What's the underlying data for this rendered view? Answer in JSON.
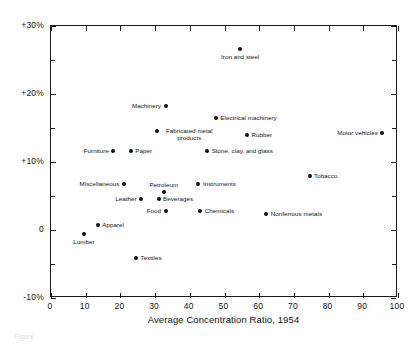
{
  "figure": {
    "top_clipped_note": "",
    "caption_clipped": "Figure"
  },
  "chart_data": {
    "type": "scatter",
    "title": "",
    "xlabel": "Average Concentration Ratio, 1954",
    "ylabel": "",
    "xlim": [
      0,
      100
    ],
    "ylim": [
      -10,
      30
    ],
    "xticks": [
      0,
      10,
      20,
      30,
      40,
      50,
      60,
      70,
      80,
      90,
      100
    ],
    "xtick_labels": [
      "0",
      "10",
      "20",
      "30",
      "40",
      "50",
      "60",
      "70",
      "80",
      "90",
      "100"
    ],
    "yticks": [
      -10,
      0,
      10,
      20,
      30
    ],
    "ytick_labels": [
      "-10%",
      "0",
      "+10%",
      "+20%",
      "+30%"
    ],
    "y_minor_ticks": [
      -5,
      5,
      15,
      25
    ],
    "x_minor_ticks": [
      5,
      15,
      25,
      35,
      45,
      55,
      65,
      75,
      85,
      95
    ],
    "grid": false,
    "legend": null,
    "marker_color": "#111111",
    "axis_color": "#1a1a1a",
    "points": [
      {
        "label": "Iron and steel",
        "x": 54.5,
        "y": 26.6,
        "label_pos": "below"
      },
      {
        "label": "Machinery",
        "x": 33.0,
        "y": 18.3,
        "label_pos": "left"
      },
      {
        "label": "Electrical machinery",
        "x": 47.5,
        "y": 16.5,
        "label_pos": "right"
      },
      {
        "label": "Motor vehicles",
        "x": 95.5,
        "y": 14.3,
        "label_pos": "left"
      },
      {
        "label": "Fabricated metal products",
        "x": 30.5,
        "y": 14.6,
        "label_pos": "multiline-right"
      },
      {
        "label": "Rubber",
        "x": 56.5,
        "y": 13.9,
        "label_pos": "right"
      },
      {
        "label": "Furniture",
        "x": 18.0,
        "y": 11.6,
        "label_pos": "left"
      },
      {
        "label": "Paper",
        "x": 23.0,
        "y": 11.6,
        "label_pos": "right"
      },
      {
        "label": "Stone, clay, and glass",
        "x": 45.0,
        "y": 11.6,
        "label_pos": "right"
      },
      {
        "label": "Tobacco",
        "x": 74.5,
        "y": 8.0,
        "label_pos": "right"
      },
      {
        "label": "Miscellaneous",
        "x": 21.0,
        "y": 6.8,
        "label_pos": "left"
      },
      {
        "label": "Instruments",
        "x": 42.5,
        "y": 6.8,
        "label_pos": "right"
      },
      {
        "label": "Petroleum",
        "x": 32.5,
        "y": 5.6,
        "label_pos": "above"
      },
      {
        "label": "Leather",
        "x": 26.0,
        "y": 4.6,
        "label_pos": "left"
      },
      {
        "label": "Beverages",
        "x": 31.0,
        "y": 4.6,
        "label_pos": "right"
      },
      {
        "label": "Food",
        "x": 33.0,
        "y": 2.8,
        "label_pos": "left"
      },
      {
        "label": "Chemicals",
        "x": 43.0,
        "y": 2.8,
        "label_pos": "right"
      },
      {
        "label": "Nonferrous metals",
        "x": 62.0,
        "y": 2.3,
        "label_pos": "right"
      },
      {
        "label": "Apparel",
        "x": 13.5,
        "y": 0.7,
        "label_pos": "right"
      },
      {
        "label": "Lumber",
        "x": 9.5,
        "y": -0.6,
        "label_pos": "below"
      },
      {
        "label": "Textiles",
        "x": 24.5,
        "y": -4.1,
        "label_pos": "right"
      }
    ]
  }
}
